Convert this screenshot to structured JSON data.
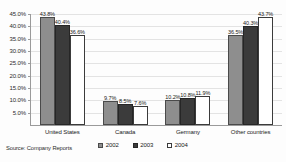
{
  "chart_data": {
    "type": "bar",
    "title": "",
    "subtitle": "",
    "xlabel": "",
    "ylabel": "",
    "categories": [
      "United States",
      "Canada",
      "Germany",
      "Other countries"
    ],
    "series": [
      {
        "name": "2002",
        "color": "#8e8e8e",
        "values": [
          43.8,
          9.7,
          10.2,
          36.5
        ]
      },
      {
        "name": "2003",
        "color": "#3b3b3b",
        "values": [
          40.4,
          8.5,
          10.8,
          40.3
        ]
      },
      {
        "name": "2004",
        "color": "#ffffff",
        "values": [
          36.6,
          7.6,
          11.9,
          43.7
        ]
      }
    ],
    "data_labels": [
      [
        "43.8%",
        "40.4%",
        "36.6%"
      ],
      [
        "9.7%",
        "8.5%",
        "7.6%"
      ],
      [
        "10.2%",
        "10.8%",
        "11.9%"
      ],
      [
        "36.5%",
        "40.3%",
        "43.7%"
      ]
    ],
    "ylim": [
      0,
      45
    ],
    "ytick_values": [
      5,
      10,
      15,
      20,
      25,
      30,
      35,
      40,
      45
    ],
    "ytick_labels": [
      "5.0%",
      "10.0%",
      "15.0%",
      "20.0%",
      "25.0%",
      "30.0%",
      "35.0%",
      "40.0%",
      "45.0%"
    ],
    "grid": true,
    "legend_position": "bottom"
  },
  "source": {
    "text": "Source: Company Reports"
  },
  "legend": {
    "items": [
      {
        "label": "2002"
      },
      {
        "label": "2003"
      },
      {
        "label": "2004"
      }
    ]
  }
}
